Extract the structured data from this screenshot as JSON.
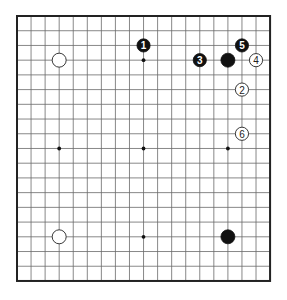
{
  "board": {
    "size": 19,
    "origin": {
      "x": 17,
      "y": 16
    },
    "spacing": {
      "x": 14.06,
      "y": 14.72
    },
    "star_points": [
      [
        3,
        3
      ],
      [
        9,
        3
      ],
      [
        15,
        3
      ],
      [
        3,
        9
      ],
      [
        9,
        9
      ],
      [
        15,
        9
      ],
      [
        3,
        15
      ],
      [
        9,
        15
      ],
      [
        15,
        15
      ]
    ],
    "colors": {
      "black": "#111111",
      "white": "#ffffff",
      "line": "#6a6a6a",
      "border": "#222222"
    }
  },
  "stones": [
    {
      "color": "white",
      "col": 3,
      "row": 3,
      "label": ""
    },
    {
      "color": "white",
      "col": 3,
      "row": 15,
      "label": ""
    },
    {
      "color": "black",
      "col": 15,
      "row": 3,
      "label": ""
    },
    {
      "color": "black",
      "col": 15,
      "row": 15,
      "label": ""
    },
    {
      "color": "black",
      "col": 9,
      "row": 2,
      "label": "1"
    },
    {
      "color": "white",
      "col": 16,
      "row": 5,
      "label": "2"
    },
    {
      "color": "black",
      "col": 13,
      "row": 3,
      "label": "3"
    },
    {
      "color": "white",
      "col": 17,
      "row": 3,
      "label": "4"
    },
    {
      "color": "black",
      "col": 16,
      "row": 2,
      "label": "5"
    },
    {
      "color": "white",
      "col": 16,
      "row": 8,
      "label": "6"
    }
  ]
}
